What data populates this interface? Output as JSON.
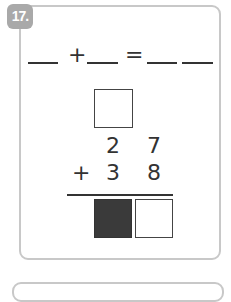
{
  "problem": {
    "number": "17.",
    "equation": {
      "plus": "+",
      "equals": "=",
      "blanks": 4
    },
    "column_addition": {
      "carry_box": "",
      "row1": [
        "2",
        "7"
      ],
      "row2_operator": "+",
      "row2": [
        "3",
        "8"
      ],
      "answer_boxes": [
        {
          "state": "filled",
          "color": "#3a3a3a"
        },
        {
          "state": "empty",
          "color": "#ffffff"
        }
      ]
    }
  }
}
